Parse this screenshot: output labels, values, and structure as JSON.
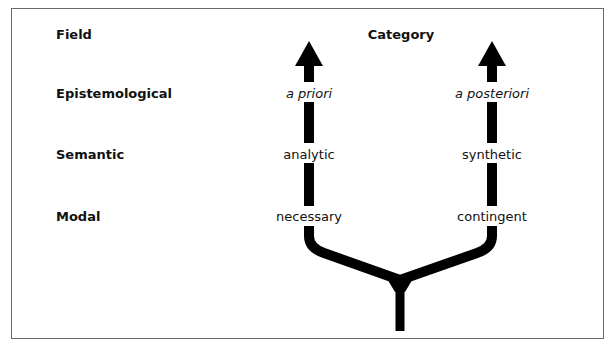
{
  "header": {
    "field_label": "Field",
    "category_label": "Category"
  },
  "rows": [
    {
      "field": "Epistemological",
      "left": "a priori",
      "right": "a posteriori"
    },
    {
      "field": "Semantic",
      "left": "analytic",
      "right": "synthetic"
    },
    {
      "field": "Modal",
      "left": "necessary",
      "right": "contingent"
    }
  ],
  "colors": {
    "arrow": "#000000",
    "border": "#6a6a6a",
    "text": "#111111"
  }
}
